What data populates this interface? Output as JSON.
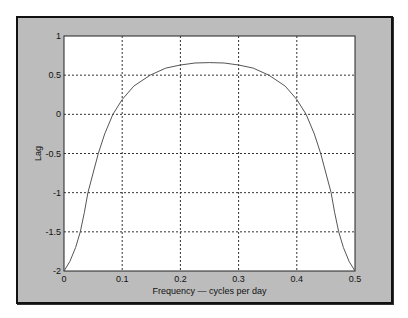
{
  "chart_data": {
    "type": "line",
    "title": "",
    "xlabel": "Frequency — cycles per day",
    "ylabel": "Lag",
    "xlim": [
      0,
      0.5
    ],
    "ylim": [
      -2,
      1
    ],
    "grid": true,
    "x_ticks": [
      "0",
      "0.1",
      "0.2",
      "0.3",
      "0.4",
      "0.5"
    ],
    "y_ticks": [
      "1",
      "0.5",
      "0",
      "-0.5",
      "-1",
      "-1.5",
      "-2"
    ],
    "series": [
      {
        "name": "Lag",
        "x": [
          0,
          0.01,
          0.02,
          0.028,
          0.035,
          0.041,
          0.05,
          0.059,
          0.07,
          0.084,
          0.1,
          0.12,
          0.148,
          0.175,
          0.2,
          0.225,
          0.25,
          0.275,
          0.3,
          0.325,
          0.352,
          0.38,
          0.4,
          0.416,
          0.43,
          0.441,
          0.45,
          0.459,
          0.465,
          0.472,
          0.48,
          0.49,
          0.5
        ],
        "y": [
          -2,
          -1.88,
          -1.7,
          -1.5,
          -1.25,
          -1.0,
          -0.75,
          -0.5,
          -0.25,
          0.0,
          0.19,
          0.36,
          0.5,
          0.59,
          0.63,
          0.655,
          0.66,
          0.655,
          0.63,
          0.59,
          0.5,
          0.36,
          0.19,
          0.0,
          -0.25,
          -0.5,
          -0.75,
          -1.0,
          -1.25,
          -1.5,
          -1.7,
          -1.88,
          -2
        ]
      }
    ],
    "line_color": "#555555"
  }
}
